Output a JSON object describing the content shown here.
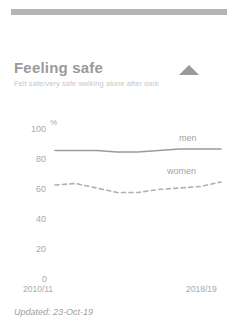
{
  "top_bar": {
    "present": true,
    "color": "#b4b4b4"
  },
  "card": {
    "title": "Feeling safe",
    "subtitle": "Felt safe/very safe walking alone after dark",
    "collapse_icon": "triangle-up-icon"
  },
  "footer": {
    "updated_label": "Updated: 23-Oct-19"
  },
  "axis": {
    "unit": "%",
    "y_ticks": [
      "100",
      "80",
      "60",
      "40",
      "20",
      "0"
    ],
    "x_start": "2010/11",
    "x_end": "2018/19"
  },
  "legend": {
    "men": "men",
    "women": "women"
  },
  "colors": {
    "men_line": "#9b9b9b",
    "women_line": "#b0b0b0",
    "text": "#a0a0a0",
    "bar": "#b4b4b4"
  },
  "chart_data": {
    "type": "line",
    "title": "Feeling safe",
    "subtitle": "Felt safe/very safe walking alone after dark",
    "xlabel": "",
    "ylabel": "%",
    "ylim": [
      0,
      100
    ],
    "grid": false,
    "legend_position": "inline-right",
    "categories": [
      "2010/11",
      "2011/12",
      "2012/13",
      "2013/14",
      "2014/15",
      "2015/16",
      "2016/17",
      "2017/18",
      "2018/19"
    ],
    "series": [
      {
        "name": "men",
        "style": "solid",
        "values": [
          85,
          85,
          85,
          84,
          84,
          85,
          86,
          86,
          86
        ]
      },
      {
        "name": "women",
        "style": "dashed",
        "values": [
          62,
          63,
          60,
          57,
          57,
          59,
          60,
          61,
          64
        ]
      }
    ]
  }
}
